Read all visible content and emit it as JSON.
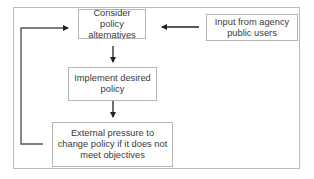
{
  "diagram": {
    "type": "flowchart",
    "nodes": [
      {
        "id": "consider",
        "label": "Consider policy alternatives"
      },
      {
        "id": "input",
        "label": "Input from agency public users"
      },
      {
        "id": "implement",
        "label": "Implement desired policy"
      },
      {
        "id": "external",
        "label": "External pressure to change policy if it does not meet objectives"
      }
    ],
    "edges": [
      {
        "from": "input",
        "to": "consider"
      },
      {
        "from": "consider",
        "to": "implement"
      },
      {
        "from": "implement",
        "to": "external"
      },
      {
        "from": "external",
        "to": "consider",
        "kind": "feedback-loop"
      }
    ],
    "colors": {
      "frame_border": "#bdbdbd",
      "node_border": "#b5b5b5",
      "text": "#3a3a3a",
      "arrow": "#222222",
      "feedback_line": "#555555"
    }
  }
}
